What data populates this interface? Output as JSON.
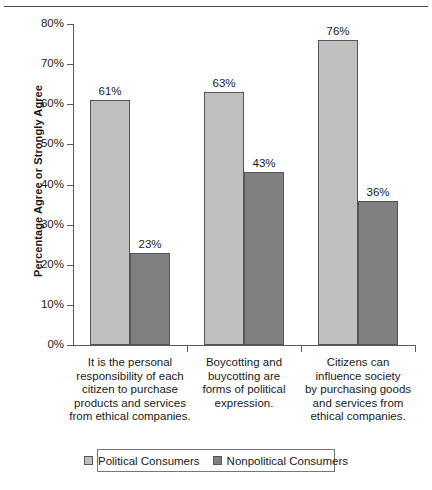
{
  "chart_data": {
    "type": "bar",
    "title": "",
    "xlabel": "",
    "ylabel": "Percentage Agree or Strongly Agree",
    "ylim": [
      0,
      80
    ],
    "ytick_labels": [
      "0%",
      "10%",
      "20%",
      "30%",
      "40%",
      "50%",
      "60%",
      "70%",
      "80%"
    ],
    "ytick_values": [
      0,
      10,
      20,
      30,
      40,
      50,
      60,
      70,
      80
    ],
    "grid": false,
    "legend_position": "bottom",
    "categories": [
      "It is the personal responsibility of each citizen to purchase products and services from ethical companies.",
      "Boycotting and buycotting are forms of political expression.",
      "Citizens can influence society by purchasing goods and services from ethical companies."
    ],
    "category_lines": [
      [
        "It is the personal",
        "responsibility of each",
        "citizen to purchase",
        "products and services",
        "from ethical companies."
      ],
      [
        "Boycotting and",
        "buycotting are",
        "forms of political",
        "expression."
      ],
      [
        "Citizens can",
        "influence society",
        "by purchasing goods",
        "and services from",
        "ethical companies."
      ]
    ],
    "series": [
      {
        "name": "Political Consumers",
        "color": "#c0c0c0",
        "values": [
          61,
          63,
          76
        ],
        "data_labels": [
          "61%",
          "63%",
          "76%"
        ]
      },
      {
        "name": "Nonpolitical Consumers",
        "color": "#808080",
        "values": [
          23,
          43,
          36
        ],
        "data_labels": [
          "23%",
          "43%",
          "36%"
        ]
      }
    ]
  },
  "legend": {
    "entries": [
      {
        "label": "Political Consumers"
      },
      {
        "label": "Nonpolitical Consumers"
      }
    ]
  }
}
